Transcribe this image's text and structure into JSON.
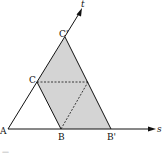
{
  "diagram": {
    "axes": {
      "s_label": "s",
      "t_label": "t"
    },
    "points": {
      "A": {
        "label": "A",
        "x": 8,
        "y": 129
      },
      "B": {
        "label": "B",
        "x": 61,
        "y": 129
      },
      "B_prime": {
        "label": "B'",
        "x": 111,
        "y": 129
      },
      "C": {
        "label": "C",
        "x": 37,
        "y": 82
      },
      "C_prime": {
        "label": "C'",
        "x": 65,
        "y": 37
      }
    },
    "shaded_region": "parallelogram C C' B' B",
    "colors": {
      "line": "#111111",
      "fill": "#d4d4d4"
    }
  },
  "caption": "—"
}
